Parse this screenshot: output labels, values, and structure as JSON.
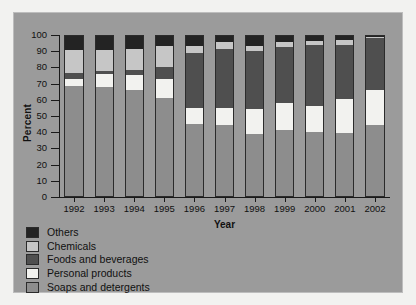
{
  "figure": {
    "background_color": "#9b9b9b",
    "page_background": "#f2f2f0"
  },
  "chart_data": {
    "type": "bar",
    "stacked": true,
    "title": "",
    "xlabel": "Year",
    "ylabel": "Percent",
    "ylim": [
      0,
      100
    ],
    "yticks": [
      0,
      10,
      20,
      30,
      40,
      50,
      60,
      70,
      80,
      90,
      100
    ],
    "ytick_labels": [
      "0",
      "10",
      "20",
      "30",
      "40",
      "50",
      "60",
      "70",
      "80",
      "90",
      "100"
    ],
    "grid": false,
    "legend_position": "below-plot-left",
    "categories": [
      "1992",
      "1993",
      "1994",
      "1995",
      "1996",
      "1997",
      "1998",
      "1999",
      "2000",
      "2001",
      "2002"
    ],
    "series": [
      {
        "name": "Soaps and detergents",
        "color": "#8d8d8d",
        "values": [
          69,
          68,
          66,
          61,
          45,
          44.5,
          38.5,
          41,
          40,
          39.5,
          44.5
        ]
      },
      {
        "name": "Personal products",
        "color": "#f2f2ef",
        "values": [
          4,
          8,
          9.5,
          12,
          10,
          10.5,
          16,
          17,
          16.5,
          21,
          22
        ]
      },
      {
        "name": "Foods and beverages",
        "color": "#4f4f4f",
        "values": [
          4,
          2,
          3,
          7.5,
          34.5,
          37,
          36,
          35,
          38,
          34,
          32.5
        ]
      },
      {
        "name": "Chemicals",
        "color": "#c6c6c6",
        "values": [
          14,
          13,
          13.5,
          13.5,
          4,
          4,
          3.5,
          3.5,
          2.5,
          3,
          0.5
        ]
      },
      {
        "name": "Others",
        "color": "#232323",
        "values": [
          9,
          9,
          8,
          6,
          6.5,
          4,
          6,
          3.5,
          3,
          2.5,
          0.5
        ]
      }
    ]
  },
  "legend": {
    "items": [
      {
        "label": "Others",
        "color": "#232323"
      },
      {
        "label": "Chemicals",
        "color": "#c6c6c6"
      },
      {
        "label": "Foods and beverages",
        "color": "#4f4f4f"
      },
      {
        "label": "Personal products",
        "color": "#f2f2ef"
      },
      {
        "label": "Soaps and detergents",
        "color": "#8d8d8d"
      }
    ]
  }
}
